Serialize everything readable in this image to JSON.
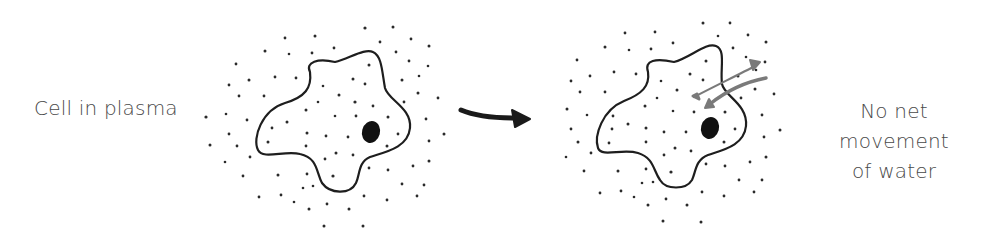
{
  "diagram": {
    "left_label": "Cell in plasma",
    "right_label_line1": "No net movement",
    "right_label_line2": "of water",
    "colors": {
      "outline": "#1e1e1e",
      "nucleus": "#111111",
      "dots": "#2a2a2a",
      "water_arrows": "#7a7a7a",
      "process_arrow": "#1a1a1a",
      "text": "#4a4a4a"
    },
    "panels": [
      {
        "name": "before",
        "description": "Cell surrounded by dots representing solute particles; same concentration inside and outside"
      },
      {
        "name": "after",
        "description": "Same cell with two grey arrows showing water moving in and out equally"
      }
    ]
  }
}
